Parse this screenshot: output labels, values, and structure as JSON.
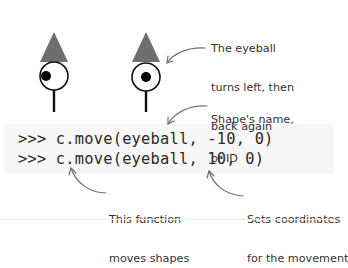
{
  "figures": [
    {
      "name": "figure-left",
      "pupil_position": "left"
    },
    {
      "name": "figure-right",
      "pupil_position": "center"
    }
  ],
  "colors": {
    "hat": "#6e6e6e",
    "outline": "#111111",
    "arrow": "#707070",
    "code_bg": "#f7f7f7",
    "text": "#333333"
  },
  "code": {
    "line1": ">>> c.move(eyeball, -10, 0)",
    "line2": ">>> c.move(eyeball, 10, 0)"
  },
  "annotations": {
    "eyeball_turns": [
      "The eyeball",
      "turns left, then",
      "back again"
    ],
    "shape_name": [
      "Shape's name,",
      "or ID"
    ],
    "function": [
      "This function",
      "moves shapes"
    ],
    "coordinates": [
      "Sets coordinates",
      "for the movement"
    ]
  }
}
